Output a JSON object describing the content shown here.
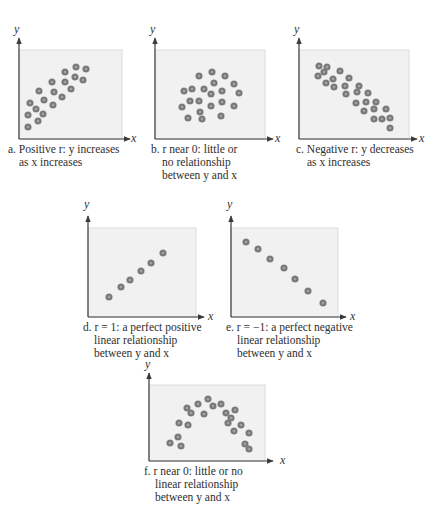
{
  "chart_data": [
    {
      "id": "a",
      "type": "scatter",
      "title": "Positive r: y increases as x increases",
      "caption_lines": [
        "a. Positive r: y increases",
        "as x increases"
      ],
      "xlabel": "x",
      "ylabel": "y",
      "frame": {
        "axis_x": 19,
        "axis_y": 139,
        "top": 50,
        "right": 122
      },
      "points": [
        [
          28,
          127
        ],
        [
          28,
          115
        ],
        [
          38,
          121
        ],
        [
          30,
          103
        ],
        [
          36,
          109
        ],
        [
          43,
          114
        ],
        [
          39,
          91
        ],
        [
          44,
          100
        ],
        [
          53,
          105
        ],
        [
          52,
          82
        ],
        [
          54,
          92
        ],
        [
          62,
          97
        ],
        [
          65,
          72
        ],
        [
          65,
          82
        ],
        [
          71,
          89
        ],
        [
          76,
          67
        ],
        [
          86,
          69
        ],
        [
          75,
          77
        ],
        [
          83,
          80
        ]
      ]
    },
    {
      "id": "b",
      "type": "scatter",
      "title": "r near 0: little or no relationship between y and x",
      "caption_lines": [
        "b. r near 0: little or",
        "no relationship",
        "between y and x"
      ],
      "xlabel": "x",
      "ylabel": "y",
      "frame": {
        "axis_x": 155,
        "axis_y": 139,
        "top": 50,
        "right": 265
      },
      "points": [
        [
          199,
          76
        ],
        [
          212,
          72
        ],
        [
          225,
          76
        ],
        [
          214,
          83
        ],
        [
          234,
          84
        ],
        [
          184,
          91
        ],
        [
          192,
          89
        ],
        [
          204,
          89
        ],
        [
          211,
          94
        ],
        [
          222,
          91
        ],
        [
          239,
          93
        ],
        [
          190,
          101
        ],
        [
          199,
          101
        ],
        [
          222,
          102
        ],
        [
          182,
          107
        ],
        [
          211,
          106
        ],
        [
          234,
          106
        ],
        [
          200,
          112
        ],
        [
          188,
          118
        ],
        [
          202,
          119
        ],
        [
          221,
          116
        ]
      ]
    },
    {
      "id": "c",
      "type": "scatter",
      "title": "Negative r: y decreases as x increases",
      "caption_lines": [
        "c. Negative r: y decreases",
        "as x increases"
      ],
      "xlabel": "x",
      "ylabel": "y",
      "frame": {
        "axis_x": 299,
        "axis_y": 139,
        "top": 50,
        "right": 409
      },
      "points": [
        [
          319,
          66
        ],
        [
          327,
          67
        ],
        [
          318,
          76
        ],
        [
          324,
          72
        ],
        [
          340,
          71
        ],
        [
          333,
          79
        ],
        [
          349,
          78
        ],
        [
          326,
          83
        ],
        [
          334,
          87
        ],
        [
          345,
          86
        ],
        [
          359,
          86
        ],
        [
          346,
          94
        ],
        [
          357,
          92
        ],
        [
          368,
          93
        ],
        [
          356,
          103
        ],
        [
          366,
          102
        ],
        [
          376,
          102
        ],
        [
          364,
          111
        ],
        [
          374,
          109
        ],
        [
          386,
          109
        ],
        [
          374,
          119
        ],
        [
          382,
          119
        ],
        [
          390,
          118
        ],
        [
          390,
          128
        ]
      ]
    },
    {
      "id": "d",
      "type": "scatter",
      "title": "r = 1: a perfect positive linear relationship between y and x",
      "caption_lines": [
        "d. r = 1: a perfect positive",
        "linear relationship",
        "between y and x"
      ],
      "xlabel": "x",
      "ylabel": "y",
      "frame": {
        "axis_x": 88,
        "axis_y": 317,
        "top": 228,
        "right": 196
      },
      "points": [
        [
          109,
          297
        ],
        [
          121,
          287
        ],
        [
          130,
          280
        ],
        [
          141,
          271
        ],
        [
          151,
          263
        ],
        [
          163,
          253
        ]
      ]
    },
    {
      "id": "e",
      "type": "scatter",
      "title": "r = −1: a perfect negative linear relationship between y and x",
      "caption_lines": [
        "e. r = −1: a perfect negative",
        "linear relationship",
        "between y and x"
      ],
      "xlabel": "x",
      "ylabel": "y",
      "frame": {
        "axis_x": 231,
        "axis_y": 317,
        "top": 228,
        "right": 338
      },
      "points": [
        [
          246,
          242
        ],
        [
          258,
          249
        ],
        [
          270,
          259
        ],
        [
          284,
          268
        ],
        [
          295,
          279
        ],
        [
          308,
          291
        ],
        [
          323,
          303
        ]
      ]
    },
    {
      "id": "f",
      "type": "scatter",
      "title": "r near 0: little or no linear relationship between y and x",
      "caption_lines": [
        "f. r near 0: little or no",
        "linear relationship",
        "between y and x"
      ],
      "xlabel": "x",
      "ylabel": "y",
      "frame": {
        "axis_x": 149,
        "axis_y": 461,
        "top": 385,
        "right": 265
      },
      "points": [
        [
          170,
          443
        ],
        [
          178,
          437
        ],
        [
          181,
          446
        ],
        [
          179,
          423
        ],
        [
          188,
          425
        ],
        [
          187,
          408
        ],
        [
          191,
          413
        ],
        [
          198,
          404
        ],
        [
          204,
          414
        ],
        [
          208,
          399
        ],
        [
          213,
          406
        ],
        [
          221,
          404
        ],
        [
          226,
          413
        ],
        [
          235,
          410
        ],
        [
          231,
          418
        ],
        [
          228,
          423
        ],
        [
          241,
          425
        ],
        [
          234,
          431
        ],
        [
          249,
          433
        ],
        [
          245,
          444
        ],
        [
          249,
          449
        ]
      ]
    }
  ],
  "style": {
    "panel_fill": "#f1f1f1",
    "panel_edge": "#dcdcdc",
    "axis_color": "#3a3a3a",
    "dot_outer": "#8a8a8a",
    "dot_ring": "#6e6e6e",
    "dot_center": "#a8a8a8"
  },
  "captions": {
    "a": {
      "l1": "a. Positive r: y increases",
      "l2": "as x increases"
    },
    "b": {
      "l1": "b. r near 0: little or",
      "l2": "no relationship",
      "l3": "between y and x"
    },
    "c": {
      "l1": "c. Negative r: y decreases",
      "l2": "as x increases"
    },
    "d": {
      "l1": "d. r = 1: a perfect positive",
      "l2": "linear relationship",
      "l3": "between y and x"
    },
    "e": {
      "l1": "e. r = −1: a perfect negative",
      "l2": "linear relationship",
      "l3": "between y and x"
    },
    "f": {
      "l1": "f. r near 0: little or no",
      "l2": "linear relationship",
      "l3": "between y and x"
    }
  },
  "axis_labels": {
    "x": "x",
    "y": "y"
  }
}
